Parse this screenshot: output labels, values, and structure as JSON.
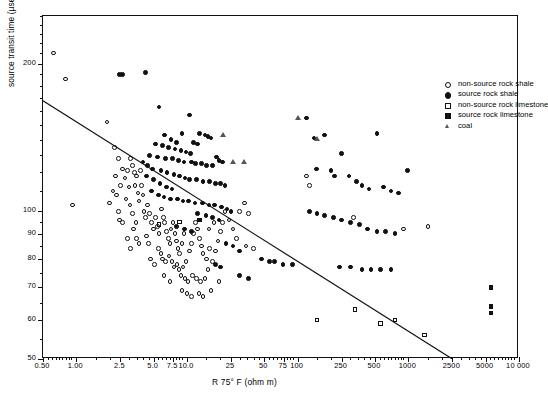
{
  "chart_data": {
    "type": "scatter",
    "title": "",
    "xlabel": "R 75° F (ohm m)",
    "ylabel": "source transit time (μsec/ft)",
    "xscale": "log",
    "yscale": "log",
    "xlim": [
      0.5,
      10000
    ],
    "ylim": [
      50,
      250
    ],
    "grid": false,
    "legend_position": "top-right",
    "xticks_labeled": [
      "0.50",
      "1.00",
      "2.5",
      "5.0",
      "7.5",
      "10.0",
      "25",
      "50",
      "75",
      "100",
      "250",
      "500",
      "1000",
      "2500",
      "5000",
      "10 000"
    ],
    "xtick_values": [
      0.5,
      1.0,
      2.5,
      5.0,
      7.5,
      10.0,
      25,
      50,
      75,
      100,
      250,
      500,
      1000,
      2500,
      5000,
      10000
    ],
    "yticks_labeled": [
      "50",
      "60",
      "70",
      "80",
      "90",
      "100",
      "200"
    ],
    "ytick_values": [
      50,
      60,
      70,
      80,
      90,
      100,
      200
    ],
    "legend": [
      {
        "label": "non-source rock shale",
        "marker": "open-circle",
        "series": "non_source_shale"
      },
      {
        "label": "source rock shale",
        "marker": "filled-circle",
        "series": "source_shale"
      },
      {
        "label": "non-source rock limestone",
        "marker": "open-square",
        "series": "non_source_limestone"
      },
      {
        "label": "source rock limestone",
        "marker": "filled-square",
        "series": "source_limestone"
      },
      {
        "label": "coal",
        "marker": "open-triangle",
        "series": "coal"
      }
    ],
    "annotations": [
      {
        "type": "line",
        "name": "regression-line",
        "x": [
          0.5,
          2500
        ],
        "y": [
          168,
          50
        ],
        "color": "#111111"
      }
    ],
    "series": [
      {
        "name": "non-source rock shale",
        "marker": "open-circle",
        "points": [
          [
            0.62,
            210
          ],
          [
            0.8,
            186
          ],
          [
            0.92,
            103
          ],
          [
            1.9,
            152
          ],
          [
            2.2,
            135
          ],
          [
            2.4,
            128
          ],
          [
            2.6,
            122
          ],
          [
            2.75,
            117
          ],
          [
            2.9,
            121
          ],
          [
            3.0,
            112
          ],
          [
            2.15,
            110
          ],
          [
            2.3,
            108
          ],
          [
            2.0,
            104
          ],
          [
            2.4,
            100
          ],
          [
            2.45,
            96
          ],
          [
            2.6,
            95
          ],
          [
            3.1,
            128
          ],
          [
            3.2,
            124
          ],
          [
            3.35,
            120
          ],
          [
            3.4,
            113
          ],
          [
            3.5,
            118
          ],
          [
            3.6,
            109
          ],
          [
            3.7,
            105
          ],
          [
            3.8,
            121
          ],
          [
            3.9,
            113
          ],
          [
            4.0,
            108
          ],
          [
            4.1,
            100
          ],
          [
            4.2,
            97
          ],
          [
            4.4,
            103
          ],
          [
            4.6,
            99
          ],
          [
            4.8,
            95
          ],
          [
            5.0,
            92
          ],
          [
            5.2,
            97
          ],
          [
            5.4,
            93
          ],
          [
            5.6,
            90
          ],
          [
            3.3,
            92
          ],
          [
            3.5,
            88
          ],
          [
            3.7,
            86
          ],
          [
            2.9,
            88
          ],
          [
            3.1,
            84
          ],
          [
            4.3,
            89
          ],
          [
            4.5,
            86
          ],
          [
            5.9,
            101
          ],
          [
            6.1,
            97
          ],
          [
            6.3,
            95
          ],
          [
            6.5,
            91
          ],
          [
            6.8,
            88
          ],
          [
            7.0,
            86
          ],
          [
            7.2,
            92
          ],
          [
            7.5,
            95
          ],
          [
            7.8,
            90
          ],
          [
            8.0,
            87
          ],
          [
            8.3,
            84
          ],
          [
            8.6,
            82
          ],
          [
            9.0,
            86
          ],
          [
            9.4,
            90
          ],
          [
            5.5,
            84
          ],
          [
            5.8,
            82
          ],
          [
            6.0,
            80
          ],
          [
            6.4,
            79
          ],
          [
            6.9,
            81
          ],
          [
            7.3,
            79
          ],
          [
            7.6,
            77
          ],
          [
            8.1,
            78
          ],
          [
            8.5,
            76
          ],
          [
            9.2,
            77
          ],
          [
            9.8,
            79
          ],
          [
            10.5,
            83
          ],
          [
            11.0,
            86
          ],
          [
            11.5,
            90
          ],
          [
            12.0,
            95
          ],
          [
            12.5,
            92
          ],
          [
            13.0,
            88
          ],
          [
            13.5,
            85
          ],
          [
            14.0,
            82
          ],
          [
            15.0,
            80
          ],
          [
            16.0,
            84
          ],
          [
            8.8,
            74
          ],
          [
            9.6,
            73
          ],
          [
            10.2,
            72
          ],
          [
            11.2,
            74
          ],
          [
            12.2,
            73
          ],
          [
            13.2,
            72
          ],
          [
            14.5,
            73
          ],
          [
            15.5,
            76
          ],
          [
            17.0,
            79
          ],
          [
            18.0,
            83
          ],
          [
            19.0,
            87
          ],
          [
            20.0,
            91
          ],
          [
            21.0,
            95
          ],
          [
            22.0,
            100
          ],
          [
            24.0,
            96
          ],
          [
            26.0,
            92
          ],
          [
            28.0,
            88
          ],
          [
            9.0,
            69
          ],
          [
            10.0,
            68
          ],
          [
            11.0,
            67
          ],
          [
            12.8,
            68
          ],
          [
            14.0,
            67
          ],
          [
            16.5,
            69
          ],
          [
            19.5,
            72
          ],
          [
            6.2,
            74
          ],
          [
            7.0,
            72
          ],
          [
            4.7,
            80
          ],
          [
            5.1,
            78
          ],
          [
            3.2,
            99
          ],
          [
            3.45,
            95
          ],
          [
            3.05,
            103
          ],
          [
            2.8,
            106
          ],
          [
            2.5,
            113
          ],
          [
            2.25,
            118
          ],
          [
            30.0,
            100
          ],
          [
            33.0,
            104
          ],
          [
            36.0,
            99
          ],
          [
            120.0,
            118
          ],
          [
            128.0,
            113
          ],
          [
            320.0,
            97
          ],
          [
            900.0,
            92
          ],
          [
            1500.0,
            93
          ],
          [
            34.0,
            85
          ],
          [
            40.0,
            84
          ],
          [
            15.8,
            92
          ],
          [
            17.5,
            95
          ]
        ]
      },
      {
        "name": "source rock shale",
        "marker": "filled-circle",
        "points": [
          [
            2.45,
            190
          ],
          [
            2.6,
            190
          ],
          [
            4.2,
            192
          ],
          [
            5.6,
            163
          ],
          [
            10.5,
            157
          ],
          [
            9.0,
            144
          ],
          [
            6.3,
            143
          ],
          [
            7.2,
            140
          ],
          [
            8.0,
            138
          ],
          [
            13.0,
            144
          ],
          [
            14.5,
            143
          ],
          [
            15.5,
            142
          ],
          [
            16.5,
            141
          ],
          [
            11.5,
            138
          ],
          [
            12.5,
            137
          ],
          [
            5.2,
            137
          ],
          [
            6.0,
            136
          ],
          [
            6.8,
            135
          ],
          [
            7.8,
            134
          ],
          [
            8.8,
            133
          ],
          [
            9.8,
            132
          ],
          [
            10.8,
            131
          ],
          [
            4.6,
            130
          ],
          [
            5.4,
            129
          ],
          [
            6.4,
            128
          ],
          [
            7.4,
            128
          ],
          [
            8.4,
            127
          ],
          [
            9.4,
            126
          ],
          [
            11.0,
            126
          ],
          [
            12.0,
            125
          ],
          [
            13.5,
            125
          ],
          [
            15.0,
            124
          ],
          [
            17.0,
            124
          ],
          [
            18.5,
            129
          ],
          [
            19.5,
            127
          ],
          [
            21.0,
            126
          ],
          [
            4.0,
            126
          ],
          [
            4.4,
            124
          ],
          [
            4.9,
            122
          ],
          [
            5.8,
            121
          ],
          [
            6.6,
            120
          ],
          [
            7.6,
            119
          ],
          [
            8.6,
            118
          ],
          [
            9.6,
            117
          ],
          [
            10.6,
            116
          ],
          [
            12.2,
            116
          ],
          [
            14.0,
            115
          ],
          [
            16.0,
            115
          ],
          [
            18.0,
            114
          ],
          [
            20.0,
            114
          ],
          [
            22.0,
            113
          ],
          [
            4.3,
            118
          ],
          [
            5.0,
            116
          ],
          [
            5.7,
            114
          ],
          [
            6.5,
            112
          ],
          [
            7.3,
            111
          ],
          [
            4.8,
            110
          ],
          [
            5.5,
            108
          ],
          [
            6.2,
            107
          ],
          [
            7.1,
            106
          ],
          [
            8.2,
            106
          ],
          [
            9.2,
            105
          ],
          [
            10.3,
            105
          ],
          [
            11.8,
            104
          ],
          [
            13.8,
            104
          ],
          [
            15.8,
            103
          ],
          [
            17.8,
            103
          ],
          [
            20.5,
            102
          ],
          [
            23.0,
            101
          ],
          [
            25.0,
            100
          ],
          [
            12.5,
            99
          ],
          [
            14.8,
            98
          ],
          [
            17.0,
            97
          ],
          [
            19.5,
            96
          ],
          [
            8.0,
            93
          ],
          [
            9.5,
            92
          ],
          [
            11.0,
            91
          ],
          [
            22.5,
            86
          ],
          [
            26.0,
            85
          ],
          [
            30.0,
            83
          ],
          [
            18.0,
            78
          ],
          [
            20.0,
            77
          ],
          [
            47.0,
            80
          ],
          [
            56.0,
            79
          ],
          [
            62.0,
            79
          ],
          [
            74.0,
            78
          ],
          [
            90.0,
            78
          ],
          [
            120.0,
            155
          ],
          [
            140.0,
            141
          ],
          [
            148.0,
            122
          ],
          [
            175.0,
            143
          ],
          [
            200.0,
            121
          ],
          [
            215.0,
            118
          ],
          [
            250.0,
            131
          ],
          [
            290.0,
            118
          ],
          [
            340.0,
            115
          ],
          [
            380.0,
            113
          ],
          [
            440.0,
            111
          ],
          [
            520.0,
            144
          ],
          [
            600.0,
            112
          ],
          [
            700.0,
            110
          ],
          [
            820.0,
            109
          ],
          [
            980.0,
            121
          ],
          [
            128.0,
            100
          ],
          [
            150.0,
            99
          ],
          [
            175.0,
            98
          ],
          [
            210.0,
            97
          ],
          [
            250.0,
            96
          ],
          [
            300.0,
            95
          ],
          [
            360.0,
            94
          ],
          [
            430.0,
            92
          ],
          [
            520.0,
            91
          ],
          [
            620.0,
            91
          ],
          [
            760.0,
            90
          ],
          [
            240.0,
            77
          ],
          [
            300.0,
            77
          ],
          [
            380.0,
            76
          ],
          [
            460.0,
            76
          ],
          [
            560.0,
            76
          ],
          [
            700.0,
            76
          ],
          [
            30.0,
            74
          ],
          [
            36.0,
            73
          ]
        ]
      },
      {
        "name": "non-source rock limestone",
        "marker": "open-square",
        "points": [
          [
            5.6,
            94
          ],
          [
            8.6,
            95
          ],
          [
            150.0,
            60
          ],
          [
            330.0,
            63
          ],
          [
            560.0,
            59
          ],
          [
            760.0,
            60
          ],
          [
            1400.0,
            56
          ]
        ]
      },
      {
        "name": "source rock limestone",
        "marker": "filled-square",
        "points": [
          [
            13.0,
            96
          ],
          [
            5600.0,
            70
          ],
          [
            5600.0,
            64
          ],
          [
            5600.0,
            62
          ]
        ]
      },
      {
        "name": "coal",
        "marker": "open-triangle",
        "points": [
          [
            21.0,
            143
          ],
          [
            26.0,
            126
          ],
          [
            33.0,
            126
          ],
          [
            100.0,
            155
          ],
          [
            150.0,
            140
          ]
        ]
      }
    ]
  }
}
